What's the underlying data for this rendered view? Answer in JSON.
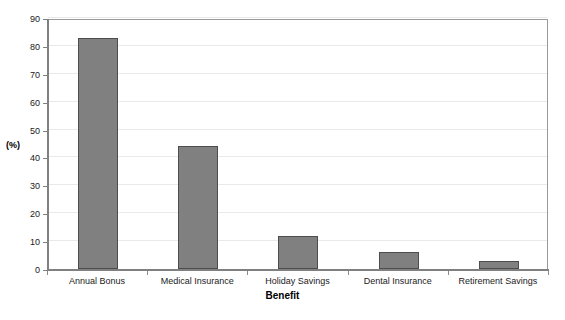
{
  "chart_data": {
    "type": "bar",
    "title": "",
    "categories": [
      "Annual Bonus",
      "Medical Insurance",
      "Holiday Savings",
      "Dental Insurance",
      "Retirement Savings"
    ],
    "values": [
      83,
      44,
      12,
      6,
      3
    ],
    "xlabel": "Benefit",
    "ylabel": "(%)",
    "ylim": [
      0,
      90
    ],
    "ytick_step": 10,
    "yticks": [
      0,
      10,
      20,
      30,
      40,
      50,
      60,
      70,
      80,
      90
    ],
    "grid": true,
    "legend": null,
    "series": [
      {
        "name": "(%)",
        "values": [
          83,
          44,
          12,
          6,
          3
        ]
      }
    ]
  },
  "style": {
    "bar_fill": "#808080",
    "bar_border": "#4d4d4d",
    "gridline_color": "#e9e9e9",
    "axis_color": "#808080",
    "plot_border": "#9a9a9a",
    "background": "#ffffff",
    "text_color": "#1a1a1a"
  }
}
